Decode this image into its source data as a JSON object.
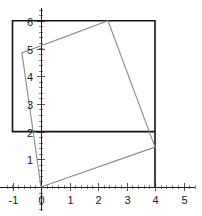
{
  "figure": {
    "title": "",
    "background_color": "#ffffff",
    "width": 202,
    "height": 216
  },
  "chart_data": {
    "type": "scatter",
    "title": "",
    "xlabel": "",
    "ylabel": "",
    "xlim": [
      -1.45,
      5.4
    ],
    "ylim": [
      -0.85,
      6.45
    ],
    "grid": false,
    "legend": null,
    "x_ticks": [
      -1,
      0,
      1,
      2,
      3,
      4,
      5
    ],
    "y_ticks": [
      1,
      2,
      3,
      4,
      5,
      6
    ],
    "x_tick_labels": [
      "-1",
      "0",
      "1",
      "2",
      "3",
      "4",
      "5"
    ],
    "y_tick_labels": [
      "1",
      "2",
      "3",
      "4",
      "5",
      "6"
    ],
    "x_minor_step": 0.2,
    "y_minor_step": 0.2,
    "axis_color": "#1a1a1a",
    "series": [
      {
        "name": "bounding-rectangle",
        "type": "polygon",
        "color": "#141414",
        "closed": true,
        "points": [
          [
            -1,
            6
          ],
          [
            4,
            6
          ],
          [
            4,
            0
          ],
          [
            4,
            2
          ],
          [
            -1,
            2
          ]
        ]
      },
      {
        "name": "rotated-square",
        "type": "polygon",
        "color": "#8a8a8a",
        "closed": true,
        "points": [
          [
            0,
            0
          ],
          [
            4,
            1.44
          ],
          [
            2.35,
            6
          ],
          [
            -0.67,
            4.84
          ]
        ]
      }
    ]
  }
}
